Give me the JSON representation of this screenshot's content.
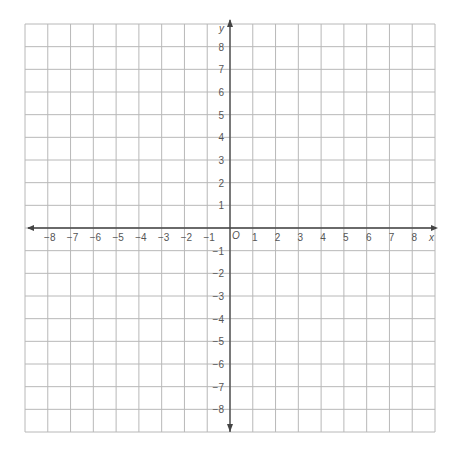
{
  "chart_data": {
    "type": "coordinate-grid",
    "title": "",
    "xlabel": "x",
    "ylabel": "y",
    "origin_label": "O",
    "xlim": [
      -9,
      9
    ],
    "ylim": [
      -9,
      9
    ],
    "grid": true,
    "x_ticks": [
      -8,
      -7,
      -6,
      -5,
      -4,
      -3,
      -2,
      -1,
      1,
      2,
      3,
      4,
      5,
      6,
      7,
      8
    ],
    "y_ticks": [
      -8,
      -7,
      -6,
      -5,
      -4,
      -3,
      -2,
      -1,
      1,
      2,
      3,
      4,
      5,
      6,
      7,
      8
    ],
    "x_tick_labels": [
      "−8",
      "−7",
      "−6",
      "−5",
      "−4",
      "−3",
      "−2",
      "−1",
      "1",
      "2",
      "3",
      "4",
      "5",
      "6",
      "7",
      "8"
    ],
    "y_tick_labels": [
      "−8",
      "−7",
      "−6",
      "−5",
      "−4",
      "−3",
      "−2",
      "−1",
      "1",
      "2",
      "3",
      "4",
      "5",
      "6",
      "7",
      "8"
    ],
    "points": []
  },
  "colors": {
    "grid": "#b8b8b8",
    "axis": "#444444",
    "label": "#555555",
    "background": "#ffffff"
  },
  "layout": {
    "left": 25,
    "right": 435,
    "top": 24,
    "bottom": 432,
    "origin_x": 230,
    "origin_y": 228,
    "cell": 22.75
  }
}
